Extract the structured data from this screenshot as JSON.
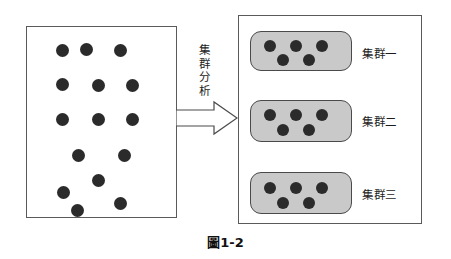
{
  "figure": {
    "caption": "圖1-2",
    "process_label_chars": [
      "集",
      "群",
      "分",
      "析"
    ],
    "process_label": "集群分析",
    "arrow_icon": "right-arrow-icon",
    "colors": {
      "dot": "#2b2b2b",
      "cluster_fill": "#c9c9c9",
      "box_border": "#5a5a5a",
      "background": "#ffffff"
    }
  },
  "source": {
    "name": "unclustered-data-box",
    "dots": [
      {
        "x": 55,
        "y": 43
      },
      {
        "x": 79,
        "y": 42
      },
      {
        "x": 113,
        "y": 43
      },
      {
        "x": 55,
        "y": 77
      },
      {
        "x": 91,
        "y": 78
      },
      {
        "x": 125,
        "y": 78
      },
      {
        "x": 55,
        "y": 112
      },
      {
        "x": 91,
        "y": 112
      },
      {
        "x": 125,
        "y": 112
      },
      {
        "x": 71,
        "y": 148
      },
      {
        "x": 117,
        "y": 148
      },
      {
        "x": 91,
        "y": 173
      },
      {
        "x": 56,
        "y": 185
      },
      {
        "x": 113,
        "y": 196
      },
      {
        "x": 70,
        "y": 203
      }
    ]
  },
  "clusters": [
    {
      "name": "cluster-one",
      "label": "集群一",
      "box": {
        "x": 250,
        "y": 31,
        "w": 102,
        "h": 40
      },
      "label_pos": {
        "x": 362,
        "y": 45
      },
      "dots": [
        {
          "x": 263,
          "y": 39
        },
        {
          "x": 289,
          "y": 39
        },
        {
          "x": 315,
          "y": 39
        },
        {
          "x": 276,
          "y": 53
        },
        {
          "x": 302,
          "y": 53
        }
      ]
    },
    {
      "name": "cluster-two",
      "label": "集群二",
      "box": {
        "x": 250,
        "y": 100,
        "w": 102,
        "h": 42
      },
      "label_pos": {
        "x": 362,
        "y": 113
      },
      "dots": [
        {
          "x": 263,
          "y": 108
        },
        {
          "x": 289,
          "y": 108
        },
        {
          "x": 315,
          "y": 108
        },
        {
          "x": 276,
          "y": 123
        },
        {
          "x": 302,
          "y": 123
        }
      ]
    },
    {
      "name": "cluster-three",
      "label": "集群三",
      "box": {
        "x": 250,
        "y": 172,
        "w": 102,
        "h": 42
      },
      "label_pos": {
        "x": 362,
        "y": 186
      },
      "dots": [
        {
          "x": 263,
          "y": 181
        },
        {
          "x": 289,
          "y": 181
        },
        {
          "x": 315,
          "y": 181
        },
        {
          "x": 276,
          "y": 196
        },
        {
          "x": 302,
          "y": 196
        }
      ]
    }
  ]
}
